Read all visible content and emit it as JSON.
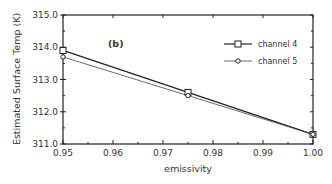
{
  "chart_data": {
    "type": "line",
    "panel_label": "(b)",
    "xlabel": "emissivity",
    "ylabel": "Estimated Surface Temp (K)",
    "xlim": [
      0.95,
      1.0
    ],
    "ylim": [
      311.0,
      315.0
    ],
    "x_ticks": [
      "0.95",
      "0.96",
      "0.97",
      "0.98",
      "0.99",
      "1.00"
    ],
    "y_ticks": [
      "311.0",
      "312.0",
      "313.0",
      "314.0",
      "315.0"
    ],
    "grid": false,
    "legend_position": "upper right",
    "x": [
      0.95,
      0.975,
      1.0
    ],
    "series": [
      {
        "name": "channel 4",
        "marker": "square",
        "values": [
          313.9,
          312.6,
          311.3
        ]
      },
      {
        "name": "channel 5",
        "marker": "circle",
        "values": [
          313.7,
          312.5,
          311.3
        ]
      }
    ]
  }
}
